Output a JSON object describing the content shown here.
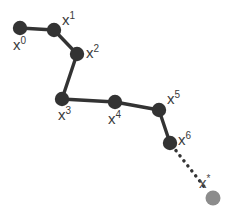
{
  "diagram": {
    "type": "iterative-optimization-path",
    "canvas": {
      "width": 243,
      "height": 215,
      "background": "#ffffff"
    },
    "style": {
      "iterate_color": "#333333",
      "target_color": "#8c8c8c",
      "path_color": "#333333",
      "dotted_path_color": "#333333",
      "label_color": "#3b3b3b",
      "path_stroke_width": 3.4,
      "dotted_stroke_width": 3.4,
      "iterate_radius": 7.0,
      "target_radius": 7.5
    },
    "nodes": [
      {
        "id": "x0",
        "base": "x",
        "sup": "0",
        "x": 20,
        "y": 28,
        "radius": 7.2,
        "color": "#333333",
        "kind": "iterate",
        "label_x": 13,
        "label_y": 36
      },
      {
        "id": "x1",
        "base": "x",
        "sup": "1",
        "x": 54,
        "y": 30,
        "radius": 7.2,
        "color": "#333333",
        "kind": "iterate",
        "label_x": 62,
        "label_y": 11
      },
      {
        "id": "x2",
        "base": "x",
        "sup": "2",
        "x": 77,
        "y": 54,
        "radius": 7.2,
        "color": "#333333",
        "kind": "iterate",
        "label_x": 86,
        "label_y": 44
      },
      {
        "id": "x3",
        "base": "x",
        "sup": "3",
        "x": 62,
        "y": 99,
        "radius": 7.2,
        "color": "#333333",
        "kind": "iterate",
        "label_x": 58,
        "label_y": 106
      },
      {
        "id": "x4",
        "base": "x",
        "sup": "4",
        "x": 115,
        "y": 102,
        "radius": 7.2,
        "color": "#333333",
        "kind": "iterate",
        "label_x": 108,
        "label_y": 110
      },
      {
        "id": "x5",
        "base": "x",
        "sup": "5",
        "x": 159,
        "y": 110,
        "radius": 7.2,
        "color": "#333333",
        "kind": "iterate",
        "label_x": 167,
        "label_y": 90
      },
      {
        "id": "x6",
        "base": "x",
        "sup": "6",
        "x": 170,
        "y": 143,
        "radius": 7.2,
        "color": "#333333",
        "kind": "iterate",
        "label_x": 178,
        "label_y": 131
      },
      {
        "id": "xstar",
        "base": "x",
        "sup": "*",
        "x": 213,
        "y": 198,
        "radius": 7.5,
        "color": "#8c8c8c",
        "kind": "target",
        "label_x": 199,
        "label_y": 174
      }
    ],
    "segments": [
      {
        "id": "seg-x0-x1",
        "from": "x0",
        "to": "x1",
        "dashed": false
      },
      {
        "id": "seg-x1-x2",
        "from": "x1",
        "to": "x2",
        "dashed": false
      },
      {
        "id": "seg-x2-x3",
        "from": "x2",
        "to": "x3",
        "dashed": false
      },
      {
        "id": "seg-x3-x4",
        "from": "x3",
        "to": "x4",
        "dashed": false
      },
      {
        "id": "seg-x4-x5",
        "from": "x4",
        "to": "x5",
        "dashed": false
      },
      {
        "id": "seg-x5-x6",
        "from": "x5",
        "to": "x6",
        "dashed": false
      },
      {
        "id": "seg-x6-xstar",
        "from": "x6",
        "to": "xstar",
        "dashed": true
      }
    ]
  }
}
